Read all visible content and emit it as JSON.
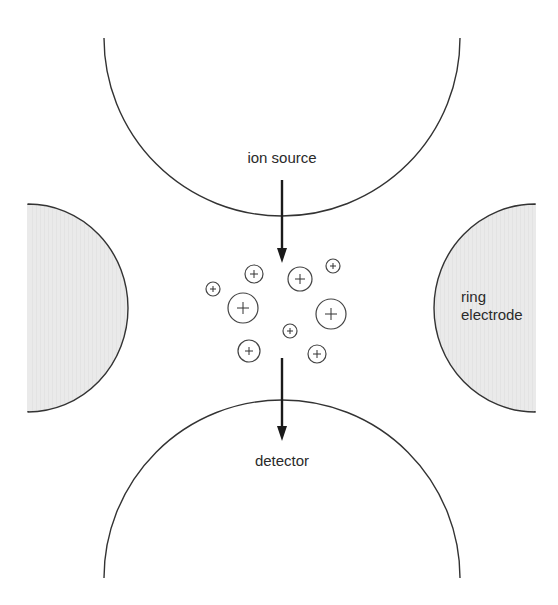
{
  "diagram": {
    "labels": {
      "ion_source": "ion source",
      "detector": "detector",
      "ring_electrode_line1": "ring",
      "ring_electrode_line2": "electrode"
    },
    "colors": {
      "electrode_fill": "#e8e8e8",
      "stroke": "#333333",
      "text": "#2a2a2a",
      "background": "#ffffff"
    },
    "components": {
      "top_end_cap": {
        "cx": 282,
        "cy": 42,
        "r": 178,
        "open": "top"
      },
      "bottom_end_cap": {
        "cx": 282,
        "cy": 576,
        "r": 178,
        "open": "bottom"
      },
      "left_ring_electrode": {
        "cx": 28,
        "cy": 308,
        "rx": 100,
        "ry": 104,
        "side": "left"
      },
      "right_ring_electrode": {
        "cx": 535,
        "cy": 308,
        "rx": 101,
        "ry": 104,
        "side": "right"
      },
      "ion_source_arrow": {
        "x": 282,
        "y1": 180,
        "y2": 262
      },
      "detector_arrow": {
        "x": 282,
        "y1": 358,
        "y2": 440
      }
    },
    "ions": [
      {
        "cx": 213,
        "cy": 289,
        "r": 7,
        "symbol": "+"
      },
      {
        "cx": 254,
        "cy": 274,
        "r": 9,
        "symbol": "+"
      },
      {
        "cx": 243,
        "cy": 308,
        "r": 15,
        "symbol": "+"
      },
      {
        "cx": 300,
        "cy": 279,
        "r": 12,
        "symbol": "+"
      },
      {
        "cx": 333,
        "cy": 266,
        "r": 7,
        "symbol": "+"
      },
      {
        "cx": 331,
        "cy": 314,
        "r": 15,
        "symbol": "+"
      },
      {
        "cx": 290,
        "cy": 331,
        "r": 7,
        "symbol": "+"
      },
      {
        "cx": 249,
        "cy": 351,
        "r": 11,
        "symbol": "+"
      },
      {
        "cx": 317,
        "cy": 354,
        "r": 9,
        "symbol": "+"
      }
    ]
  }
}
